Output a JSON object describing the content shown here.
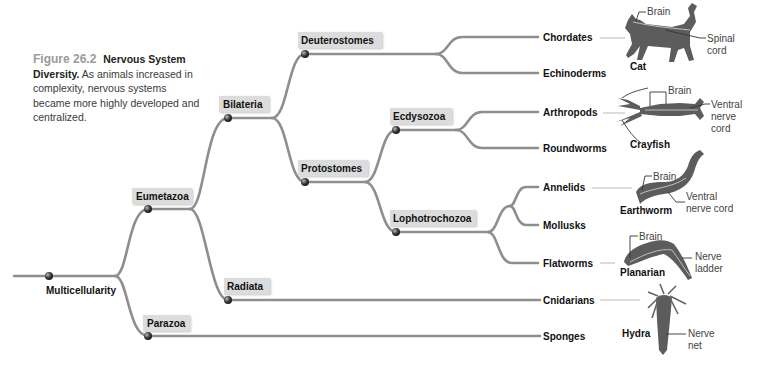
{
  "caption": {
    "figure_number": "Figure 26.2",
    "title": "Nervous System Diversity.",
    "text": "As animals increased in complexity, nervous systems became more highly developed and centralized."
  },
  "tree": {
    "root": "Multicellularity",
    "clades": {
      "eumetazoa": "Eumetazoa",
      "parazoa": "Parazoa",
      "bilateria": "Bilateria",
      "radiata": "Radiata",
      "deuterostomes": "Deuterostomes",
      "protostomes": "Protostomes",
      "ecdysozoa": "Ecdysozoa",
      "lophotrochozoa": "Lophotrochozoa"
    },
    "leaves": {
      "chordates": "Chordates",
      "echinoderms": "Echinoderms",
      "arthropods": "Arthropods",
      "roundworms": "Roundworms",
      "annelids": "Annelids",
      "mollusks": "Mollusks",
      "flatworms": "Flatworms",
      "cnidarians": "Cnidarians",
      "sponges": "Sponges"
    }
  },
  "animals": {
    "cat": {
      "name": "Cat",
      "labels": [
        "Brain",
        "Spinal",
        "cord"
      ]
    },
    "crayfish": {
      "name": "Crayfish",
      "labels": [
        "Brain",
        "Ventral",
        "nerve",
        "cord"
      ]
    },
    "earthworm": {
      "name": "Earthworm",
      "labels": [
        "Brain",
        "Ventral",
        "nerve cord"
      ]
    },
    "planarian": {
      "name": "Planarian",
      "labels": [
        "Brain",
        "Nerve",
        "ladder"
      ]
    },
    "hydra": {
      "name": "Hydra",
      "labels": [
        "Nerve",
        "net"
      ]
    }
  }
}
